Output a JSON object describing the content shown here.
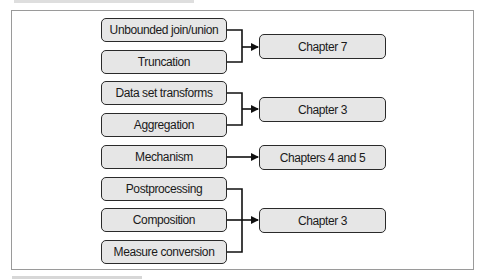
{
  "diagram": {
    "groups": [
      {
        "sources": [
          "Unbounded join/union",
          "Truncation"
        ],
        "target": "Chapter 7"
      },
      {
        "sources": [
          "Data set transforms",
          "Aggregation"
        ],
        "target": "Chapter 3"
      },
      {
        "sources": [
          "Mechanism"
        ],
        "target": "Chapters 4 and 5"
      },
      {
        "sources": [
          "Postprocessing",
          "Composition",
          "Measure conversion"
        ],
        "target": "Chapter 3"
      }
    ]
  },
  "colors": {
    "box_fill": "#e6e6e6",
    "box_border": "#2a2a2a",
    "connector": "#111111",
    "frame": "#9a9a9a"
  }
}
